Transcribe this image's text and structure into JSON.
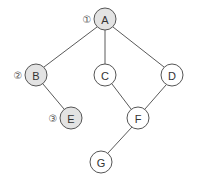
{
  "diagram": {
    "type": "tree-graph",
    "node_radius": 11,
    "colors": {
      "visited_fill": "#e3e3e3",
      "unvisited_fill": "#ffffff",
      "stroke": "#555555",
      "edge": "#5a5a5a"
    },
    "nodes": [
      {
        "id": "A",
        "label": "A",
        "x": 105,
        "y": 19,
        "visited": true,
        "order": "①"
      },
      {
        "id": "B",
        "label": "B",
        "x": 36,
        "y": 75,
        "visited": true,
        "order": "②"
      },
      {
        "id": "C",
        "label": "C",
        "x": 105,
        "y": 75,
        "visited": false,
        "order": ""
      },
      {
        "id": "D",
        "label": "D",
        "x": 172,
        "y": 75,
        "visited": false,
        "order": ""
      },
      {
        "id": "E",
        "label": "E",
        "x": 71,
        "y": 118,
        "visited": true,
        "order": "③"
      },
      {
        "id": "F",
        "label": "F",
        "x": 138,
        "y": 118,
        "visited": false,
        "order": ""
      },
      {
        "id": "G",
        "label": "G",
        "x": 101,
        "y": 162,
        "visited": false,
        "order": ""
      }
    ],
    "edges": [
      {
        "from": "A",
        "to": "B"
      },
      {
        "from": "A",
        "to": "C"
      },
      {
        "from": "A",
        "to": "D"
      },
      {
        "from": "B",
        "to": "E"
      },
      {
        "from": "C",
        "to": "F"
      },
      {
        "from": "D",
        "to": "F"
      },
      {
        "from": "F",
        "to": "G"
      }
    ]
  }
}
